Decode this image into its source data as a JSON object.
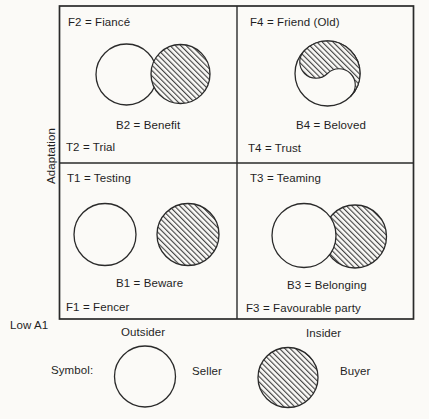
{
  "figure": {
    "background_color": "#fbfaf7",
    "line_color": "#2a2a2a",
    "hatch_color": "#333333",
    "y_axis": {
      "label": "Adaptation",
      "origin_label": "Low A1"
    },
    "x_axis": {
      "categories": [
        "Outsider",
        "Insider"
      ]
    },
    "quadrants": {
      "top_left": {
        "f_label": "F2 = Fiancé",
        "b_label": "B2 = Benefit",
        "t_label": "T2 = Trial"
      },
      "top_right": {
        "f_label": "F4 = Friend (Old)",
        "b_label": "B4 = Beloved",
        "t_label": "T4 = Trust"
      },
      "bottom_left": {
        "t_label": "T1 = Testing",
        "b_label": "B1 = Beware",
        "f_label": "F1 = Fencer"
      },
      "bottom_right": {
        "t_label": "T3 = Teaming",
        "b_label": "B3 = Belonging",
        "f_label": "F3 = Favourable party"
      }
    },
    "legend": {
      "title": "Symbol:",
      "seller": {
        "symbol": "open-circle",
        "label": "Seller"
      },
      "buyer": {
        "symbol": "hatched-circle",
        "label": "Buyer"
      }
    }
  }
}
